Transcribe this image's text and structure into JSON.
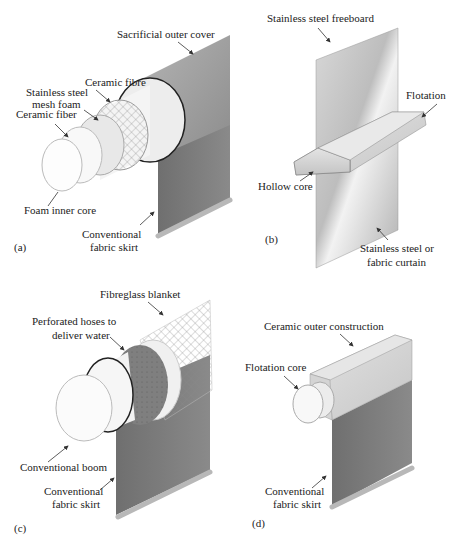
{
  "figure": {
    "panels": [
      {
        "id": "a",
        "tag": "(a)",
        "labels": {
          "outer_cover": "Sacrificial outer cover",
          "ceramic_fibre": "Ceramic fibre",
          "mesh_line1": "Stainless steel",
          "mesh_line2": "mesh foam",
          "ceramic_fiber": "Ceramic fiber",
          "inner_core": "Foam inner core",
          "skirt_line1": "Conventional",
          "skirt_line2": "fabric skirt"
        }
      },
      {
        "id": "b",
        "tag": "(b)",
        "labels": {
          "freeboard": "Stainless steel freeboard",
          "flotation": "Flotation",
          "hollow_core": "Hollow core",
          "curtain_line1": "Stainless steel or",
          "curtain_line2": "fabric curtain"
        }
      },
      {
        "id": "c",
        "tag": "(c)",
        "labels": {
          "blanket": "Fibreglass blanket",
          "hoses_line1": "Perforated hoses to",
          "hoses_line2": "deliver water",
          "boom": "Conventional boom",
          "skirt_line1": "Conventional",
          "skirt_line2": "fabric skirt"
        }
      },
      {
        "id": "d",
        "tag": "(d)",
        "labels": {
          "outer": "Ceramic outer construction",
          "core": "Flotation core",
          "skirt_line1": "Conventional",
          "skirt_line2": "fabric skirt"
        }
      }
    ],
    "colors": {
      "outer_cover": "#9a9a9a",
      "skirt": "#7a7a7a",
      "light_layer": "#efefef",
      "steel": "#cfcfcf",
      "ring_dark": "#2a2a2a"
    }
  }
}
